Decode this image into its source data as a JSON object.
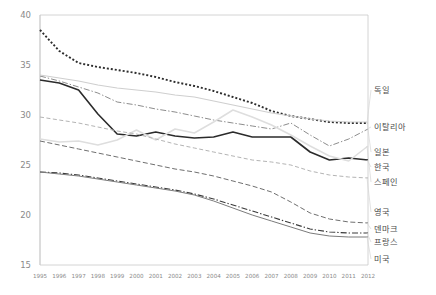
{
  "chart_data": {
    "type": "line",
    "title": "",
    "xlabel": "",
    "ylabel": "",
    "xlim": [
      1995,
      2012
    ],
    "ylim": [
      15,
      40
    ],
    "yticks": [
      15,
      20,
      25,
      30,
      35,
      40
    ],
    "grid": false,
    "legend_position": "right-outside",
    "x": [
      1995,
      1996,
      1997,
      1998,
      1999,
      2000,
      2001,
      2002,
      2003,
      2004,
      2005,
      2006,
      2007,
      2008,
      2009,
      2010,
      2011,
      2012
    ],
    "series": [
      {
        "name": "독일",
        "style": "dotted",
        "color": "#2d2d2d",
        "values": [
          38.5,
          36.4,
          35.2,
          34.8,
          34.5,
          34.2,
          33.8,
          33.3,
          32.9,
          32.4,
          31.8,
          31.2,
          30.4,
          29.9,
          29.6,
          29.3,
          29.2,
          29.2
        ]
      },
      {
        "name": "이탈리아",
        "style": "dashdot",
        "color": "#8d8d8d",
        "values": [
          33.9,
          33.4,
          32.8,
          32.2,
          31.3,
          31.0,
          30.6,
          30.3,
          29.9,
          29.5,
          29.2,
          28.9,
          28.6,
          29.2,
          28.0,
          26.9,
          27.6,
          28.6
        ]
      },
      {
        "name": "일본",
        "style": "solid-light",
        "color": "#cfcfcf",
        "values": [
          34.0,
          33.7,
          33.4,
          33.0,
          32.7,
          32.5,
          32.3,
          32.0,
          31.8,
          31.4,
          31.0,
          30.6,
          30.2,
          29.9,
          29.6,
          29.4,
          29.3,
          29.3
        ]
      },
      {
        "name": "한국",
        "style": "solid-dark",
        "color": "#2b2b2b",
        "values": [
          33.5,
          33.2,
          32.5,
          30.1,
          28.1,
          27.9,
          28.3,
          27.9,
          27.7,
          27.8,
          28.3,
          27.8,
          27.8,
          27.8,
          26.3,
          25.5,
          25.7,
          25.5
        ]
      },
      {
        "name": "스페인",
        "style": "solid-pale",
        "color": "#dedede",
        "values": [
          27.6,
          27.3,
          27.4,
          27.0,
          27.5,
          28.5,
          27.5,
          28.6,
          28.2,
          29.3,
          30.5,
          29.8,
          29.0,
          28.0,
          26.9,
          25.9,
          25.4,
          26.9
        ]
      },
      {
        "name": "영국",
        "style": "dashed-light",
        "color": "#b4b4b4",
        "values": [
          29.8,
          29.5,
          29.2,
          28.8,
          28.4,
          28.1,
          27.6,
          27.1,
          26.7,
          26.3,
          25.9,
          25.5,
          25.3,
          25.0,
          24.4,
          24.0,
          23.8,
          23.7
        ]
      },
      {
        "name": "덴마크",
        "style": "dashed",
        "color": "#6f6f6f",
        "values": [
          27.4,
          27.0,
          26.6,
          26.2,
          25.8,
          25.4,
          25.0,
          24.6,
          24.3,
          23.9,
          23.4,
          22.9,
          22.3,
          21.3,
          20.2,
          19.6,
          19.3,
          19.2
        ]
      },
      {
        "name": "프랑스",
        "style": "dashdot-dark",
        "color": "#3a3a3a",
        "values": [
          24.3,
          24.2,
          24.0,
          23.7,
          23.4,
          23.1,
          22.8,
          22.5,
          22.1,
          21.6,
          21.0,
          20.4,
          19.8,
          19.2,
          18.6,
          18.3,
          18.2,
          18.2
        ]
      },
      {
        "name": "미국",
        "style": "solid-gray",
        "color": "#7b7b7b",
        "values": [
          24.3,
          24.1,
          23.9,
          23.6,
          23.3,
          23.0,
          22.7,
          22.4,
          22.0,
          21.4,
          20.7,
          20.0,
          19.4,
          18.8,
          18.2,
          17.9,
          17.8,
          17.8
        ]
      }
    ]
  },
  "legend": {
    "items": [
      {
        "label": "독일"
      },
      {
        "label": "이탈리아"
      },
      {
        "label": "일본"
      },
      {
        "label": "한국"
      },
      {
        "label": "스페인"
      },
      {
        "label": "영국"
      },
      {
        "label": "덴마크"
      },
      {
        "label": "프랑스"
      },
      {
        "label": "미국"
      }
    ]
  }
}
